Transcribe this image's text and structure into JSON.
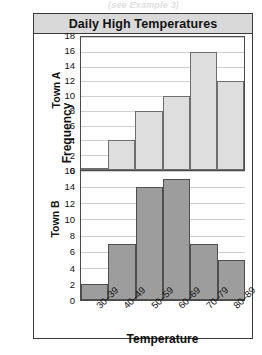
{
  "page_scrap": "(see Example 3)",
  "chart_data": {
    "type": "bar",
    "title": "Daily High Temperatures",
    "xlabel": "Temperature",
    "ylabel": "Frequency",
    "grid": true,
    "legend": "none",
    "categories": [
      "30–39",
      "40–49",
      "50–59",
      "60–69",
      "70–79",
      "80–89"
    ],
    "panels": [
      {
        "name": "Town A",
        "values": [
          0,
          4,
          8,
          10,
          16,
          12
        ],
        "ylim": [
          0,
          18
        ],
        "yticks": [
          0,
          2,
          4,
          6,
          8,
          10,
          12,
          14,
          16,
          18
        ],
        "bar_fill": "#dedede",
        "bar_stroke": "#6e6e6e"
      },
      {
        "name": "Town B",
        "values": [
          2,
          7,
          14,
          15,
          7,
          5
        ],
        "ylim": [
          0,
          16
        ],
        "yticks": [
          0,
          2,
          4,
          6,
          8,
          10,
          12,
          14,
          16
        ],
        "bar_fill": "#9d9d9d",
        "bar_stroke": "#4f4f4f"
      }
    ]
  },
  "colors": {
    "title_bar": "#d9d9d9",
    "frame": "#3a3a3a",
    "gridline": "#d0d0d0"
  }
}
